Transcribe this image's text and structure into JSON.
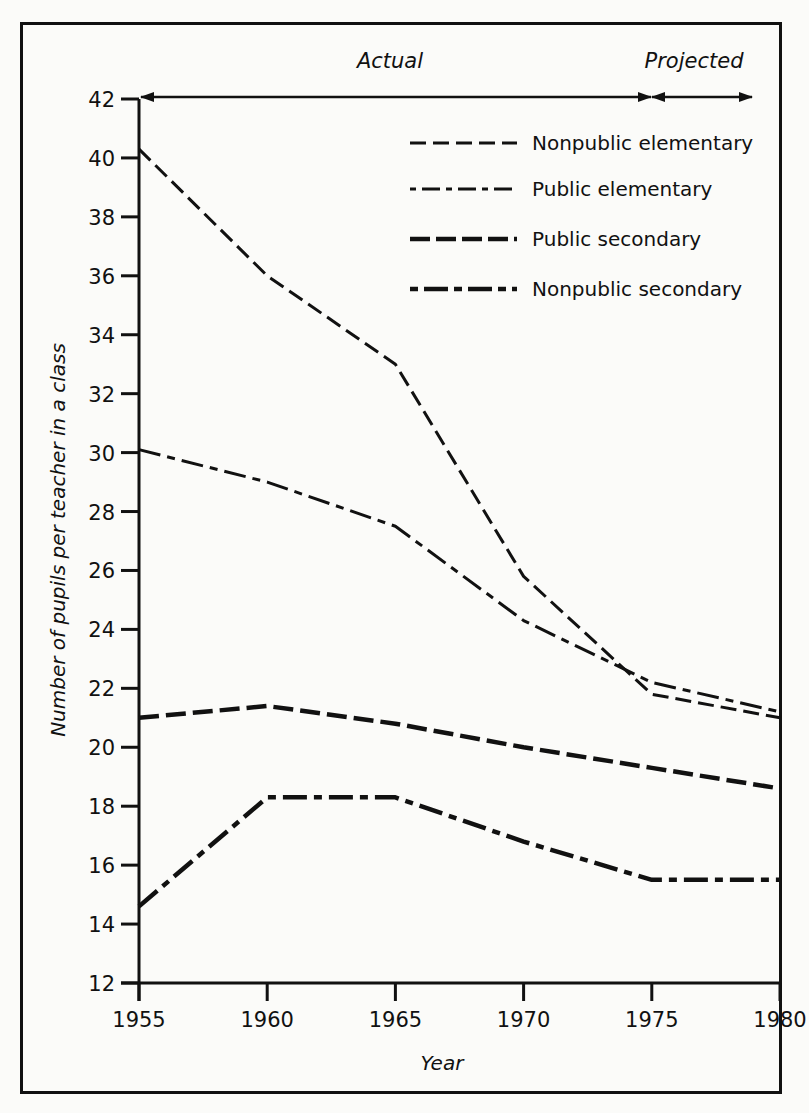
{
  "chart_data": {
    "type": "line",
    "title": "",
    "xlabel": "Year",
    "ylabel": "Number of pupils per teacher in a class",
    "x": [
      1955,
      1960,
      1965,
      1970,
      1975,
      1980
    ],
    "xticks": [
      "1955",
      "1960",
      "1965",
      "1970",
      "1975",
      "1980"
    ],
    "yticks": [
      "12",
      "14",
      "16",
      "18",
      "20",
      "22",
      "24",
      "26",
      "28",
      "30",
      "32",
      "34",
      "36",
      "38",
      "40",
      "42"
    ],
    "xlim": [
      1955,
      1980
    ],
    "ylim": [
      12,
      42
    ],
    "grid": false,
    "legend_position": "upper right",
    "annotations": [
      {
        "text": "Actual",
        "range": [
          1955,
          1975
        ]
      },
      {
        "text": "Projected",
        "range": [
          1975,
          1980
        ]
      }
    ],
    "series": [
      {
        "name": "Nonpublic elementary",
        "style": "short-dash",
        "values": [
          40.3,
          36.0,
          33.0,
          25.8,
          21.8,
          21.0
        ]
      },
      {
        "name": "Public elementary",
        "style": "long-short-dash",
        "values": [
          30.1,
          29.0,
          27.5,
          24.3,
          22.2,
          21.2
        ]
      },
      {
        "name": "Public secondary",
        "style": "thick-dash",
        "values": [
          21.0,
          21.4,
          20.8,
          20.0,
          19.3,
          18.6
        ]
      },
      {
        "name": "Nonpublic secondary",
        "style": "thick-dash-dot",
        "values": [
          14.6,
          18.3,
          18.3,
          16.8,
          15.5,
          15.5
        ]
      }
    ]
  },
  "labels": {
    "actual": "Actual",
    "projected": "Projected",
    "xlabel": "Year",
    "ylabel": "Number of pupils per teacher in a class"
  },
  "legend": [
    {
      "label": "Nonpublic elementary"
    },
    {
      "label": "Public elementary"
    },
    {
      "label": "Public secondary"
    },
    {
      "label": "Nonpublic secondary"
    }
  ],
  "colors": {
    "ink": "#111111",
    "paper": "#fbfbf9"
  }
}
